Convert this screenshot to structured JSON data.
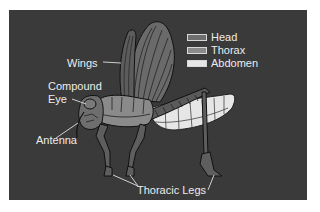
{
  "diagram": {
    "background_color": "#3a3a3a",
    "labels": {
      "wings": "Wings",
      "compound_eye_line1": "Compound",
      "compound_eye_line2": "Eye",
      "antenna": "Antenna",
      "thoracic_legs": "Thoracic Legs"
    },
    "legend": [
      {
        "label": "Head",
        "color": "#6e6e6e"
      },
      {
        "label": "Thorax",
        "color": "#8a8a8a"
      },
      {
        "label": "Abdomen",
        "color": "#e6e6e6"
      }
    ]
  }
}
